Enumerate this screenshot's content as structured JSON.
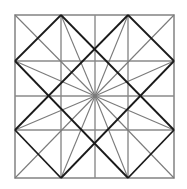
{
  "diagram": {
    "title": "",
    "outer_square": {
      "x1": 15,
      "y1": 15,
      "x2": 174,
      "y2": 178
    },
    "grid_x": [
      61,
      95,
      128
    ],
    "grid_y": [
      61,
      96,
      130
    ],
    "center": [
      95,
      96
    ],
    "colors": {
      "grid": "#8a8a8a",
      "dark": "#1a1a1a",
      "ray": "#7a7a7a",
      "background": "#ffffff"
    }
  }
}
